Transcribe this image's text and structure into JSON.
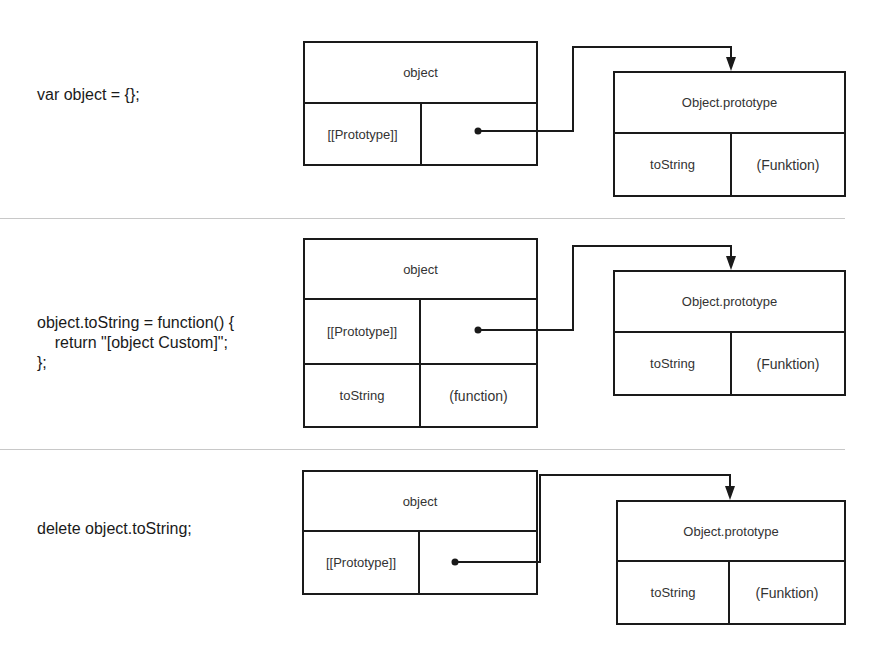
{
  "panels": [
    {
      "code": "var object = {};",
      "object_box": {
        "title": "object",
        "rows": [
          {
            "key": "[[Prototype]]",
            "value": ""
          }
        ]
      },
      "prototype_box": {
        "title": "Object.prototype",
        "rows": [
          {
            "key": "toString",
            "value": "(Funktion)"
          }
        ]
      }
    },
    {
      "code": "object.toString = function() {\n    return \"[object Custom]\";\n};",
      "object_box": {
        "title": "object",
        "rows": [
          {
            "key": "[[Prototype]]",
            "value": ""
          },
          {
            "key": "toString",
            "value": "(function)"
          }
        ]
      },
      "prototype_box": {
        "title": "Object.prototype",
        "rows": [
          {
            "key": "toString",
            "value": "(Funktion)"
          }
        ]
      }
    },
    {
      "code": "delete object.toString;",
      "object_box": {
        "title": "object",
        "rows": [
          {
            "key": "[[Prototype]]",
            "value": ""
          }
        ]
      },
      "prototype_box": {
        "title": "Object.prototype",
        "rows": [
          {
            "key": "toString",
            "value": "(Funktion)"
          }
        ]
      }
    }
  ],
  "colors": {
    "stroke": "#1a1a1a",
    "separator": "#c8c8c8",
    "text": "#333333"
  }
}
